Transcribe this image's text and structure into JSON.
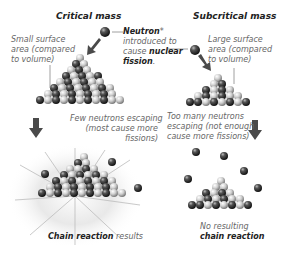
{
  "diagram": {
    "left_panel": {
      "title": "Critical mass",
      "surface_label": [
        "Small surface",
        "area (compared",
        "to volume)"
      ],
      "escape_label": [
        "Few neutrons escaping",
        "(most cause more",
        "fissions)"
      ],
      "result_bold": "Chain reaction",
      "result_rest": " results"
    },
    "center": {
      "neutron_bold": "Neutron",
      "neutron_asterisk": "*",
      "neutron_line2": "introduced to",
      "neutron_line3_pre": "cause ",
      "neutron_line3_bold": "nuclear",
      "neutron_line4_bold": "fission",
      "neutron_line4_rest": "."
    },
    "right_panel": {
      "title": "Subcritical mass",
      "surface_label": [
        "Large surface",
        "area (compared",
        "to volume)"
      ],
      "escape_label": [
        "Too many neutrons",
        "escaping (not enough",
        "cause more fissions)"
      ],
      "result_line1": "No resulting",
      "result_bold": "chain reaction"
    },
    "colors": {
      "dark_sphere": "#3a3a3a",
      "light_sphere": "#c8c8c8",
      "arrow": "#4a4a4a",
      "text_label": "#666666",
      "text_title": "#222222"
    }
  }
}
